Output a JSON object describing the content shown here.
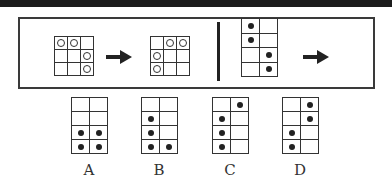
{
  "puzzle": {
    "example_pair": {
      "before": {
        "rows": 3,
        "cols": 3,
        "marker": "circle",
        "cells": [
          [
            0,
            0
          ],
          [
            0,
            1
          ],
          [
            1,
            2
          ],
          [
            2,
            2
          ]
        ]
      },
      "after": {
        "rows": 3,
        "cols": 3,
        "marker": "circle",
        "cells": [
          [
            0,
            1
          ],
          [
            0,
            2
          ],
          [
            1,
            0
          ],
          [
            2,
            0
          ]
        ]
      }
    },
    "question": {
      "rows": 4,
      "cols": 2,
      "marker": "dot",
      "cells": [
        [
          0,
          0
        ],
        [
          1,
          0
        ],
        [
          2,
          1
        ],
        [
          3,
          1
        ]
      ]
    },
    "arrow_icon": "right-arrow-icon"
  },
  "options": [
    {
      "label": "A",
      "rows": 4,
      "cols": 2,
      "cells": [
        [
          2,
          0
        ],
        [
          2,
          1
        ],
        [
          3,
          0
        ],
        [
          3,
          1
        ]
      ]
    },
    {
      "label": "B",
      "rows": 4,
      "cols": 2,
      "cells": [
        [
          1,
          0
        ],
        [
          2,
          0
        ],
        [
          3,
          0
        ],
        [
          3,
          1
        ]
      ]
    },
    {
      "label": "C",
      "rows": 4,
      "cols": 2,
      "cells": [
        [
          0,
          1
        ],
        [
          1,
          0
        ],
        [
          2,
          0
        ],
        [
          3,
          0
        ]
      ]
    },
    {
      "label": "D",
      "rows": 4,
      "cols": 2,
      "cells": [
        [
          0,
          1
        ],
        [
          1,
          1
        ],
        [
          2,
          0
        ],
        [
          3,
          0
        ]
      ]
    }
  ],
  "colors": {
    "line": "#333333",
    "marker": "#222222",
    "band": "#1c1c1c"
  }
}
